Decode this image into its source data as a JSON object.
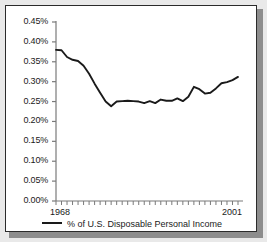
{
  "figure": {
    "background_color": "#e9e9e9",
    "panel_color": "#ffffff",
    "border_color": "#2b2b2b",
    "shadow_color": "#8d8d8d",
    "line_color": "#1a1a1a"
  },
  "legend": {
    "label": "% of U.S. Disposable Personal Income",
    "swatch": "line-swatch",
    "position": "bottom-center"
  },
  "chart_data": {
    "type": "line",
    "title": "",
    "subtitle": "",
    "xlabel": "",
    "ylabel": "",
    "grid": false,
    "legend_position": "bottom-center",
    "xlim": [
      1968,
      2001
    ],
    "ylim": [
      0.0,
      0.45
    ],
    "ytick_labels": [
      "0.45%",
      "0.40%",
      "0.35%",
      "0.30%",
      "0.25%",
      "0.20%",
      "0.15%",
      "0.10%",
      "0.05%",
      "0.00%"
    ],
    "ytick_values": [
      0.45,
      0.4,
      0.35,
      0.3,
      0.25,
      0.2,
      0.15,
      0.1,
      0.05,
      0.0
    ],
    "xtick_labels": [
      "1968",
      "2001"
    ],
    "xtick_values": [
      1968,
      2001
    ],
    "x_minor_ticks_every": 1,
    "series": [
      {
        "name": "% of U.S. Disposable Personal Income",
        "x": [
          1968,
          1969,
          1970,
          1971,
          1972,
          1973,
          1974,
          1975,
          1976,
          1977,
          1978,
          1979,
          1980,
          1981,
          1982,
          1983,
          1984,
          1985,
          1986,
          1987,
          1988,
          1989,
          1990,
          1991,
          1992,
          1993,
          1994,
          1995,
          1996,
          1997,
          1998,
          1999,
          2000,
          2001
        ],
        "values": [
          0.38,
          0.379,
          0.362,
          0.355,
          0.352,
          0.34,
          0.32,
          0.295,
          0.272,
          0.25,
          0.238,
          0.25,
          0.251,
          0.252,
          0.251,
          0.25,
          0.246,
          0.251,
          0.246,
          0.255,
          0.252,
          0.252,
          0.258,
          0.251,
          0.262,
          0.287,
          0.281,
          0.27,
          0.272,
          0.283,
          0.296,
          0.299,
          0.304,
          0.312
        ]
      }
    ],
    "series_extended_note": "",
    "units": "percent"
  }
}
